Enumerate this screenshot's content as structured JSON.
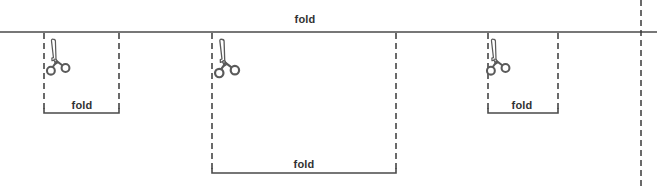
{
  "diagram": {
    "colors": {
      "solid_line": "#4a4a4a",
      "dashed_line": "#3a3a3a",
      "scissors_stroke": "#5a5a5a",
      "label_text": "#333333",
      "background": "#ffffff"
    },
    "horizontal_fold_line": {
      "label": "fold",
      "y": 32,
      "x_start": 0,
      "x_end": 657,
      "style": "solid"
    },
    "labels": [
      {
        "name": "top-fold-label",
        "text": "fold",
        "x": 305,
        "y": 19
      },
      {
        "name": "left-fold-label",
        "text": "fold",
        "x": 82,
        "y": 105
      },
      {
        "name": "center-fold-label",
        "text": "fold",
        "x": 304,
        "y": 164
      },
      {
        "name": "right-fold-label",
        "text": "fold",
        "x": 522,
        "y": 105
      }
    ],
    "cut_regions": [
      {
        "name": "left-cut-region",
        "x_left": 44,
        "x_right": 119,
        "y_top": 32,
        "y_bottom": 113,
        "label": "fold",
        "scissors": {
          "x": 46,
          "y": 38,
          "width": 30,
          "height": 45
        }
      },
      {
        "name": "center-cut-region",
        "x_left": 212,
        "x_right": 396,
        "y_top": 32,
        "y_bottom": 173,
        "label": "fold",
        "scissors": {
          "x": 214,
          "y": 38,
          "width": 32,
          "height": 48
        }
      },
      {
        "name": "right-cut-region",
        "x_left": 488,
        "x_right": 558,
        "y_top": 32,
        "y_bottom": 113,
        "label": "fold",
        "scissors": {
          "x": 486,
          "y": 38,
          "width": 30,
          "height": 45
        }
      }
    ],
    "edge_guide": {
      "name": "right-edge-dashed-line",
      "x": 641,
      "y_start": 0,
      "y_end": 186,
      "style": "dashed"
    }
  }
}
